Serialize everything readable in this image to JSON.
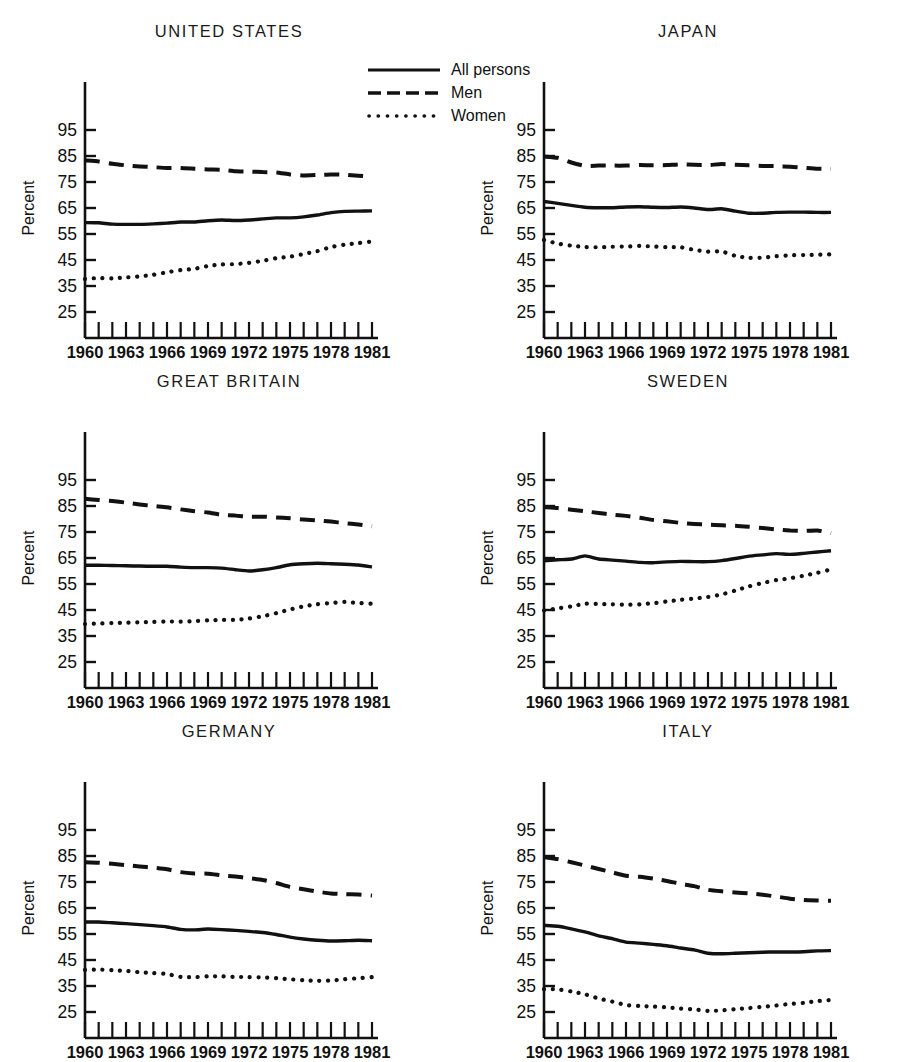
{
  "figure": {
    "ylabel": "Percent",
    "y_ticks": [
      95,
      85,
      75,
      65,
      55,
      45,
      35,
      25
    ],
    "y_tick_labels": [
      "95",
      "85",
      "75",
      "65",
      "55",
      "45",
      "35",
      "25"
    ],
    "x_tick_labels": [
      "1960",
      "1963",
      "1966",
      "1969",
      "1972",
      "1975",
      "1978",
      "1981"
    ],
    "x_label_years": [
      1960,
      1963,
      1966,
      1969,
      1972,
      1975,
      1978,
      1981
    ],
    "line_color": "#111111"
  },
  "legend": {
    "position": "top-center",
    "items": [
      {
        "label": "All persons",
        "style": "solid"
      },
      {
        "label": "Men",
        "style": "dashed"
      },
      {
        "label": "Women",
        "style": "dotted"
      }
    ]
  },
  "chart_data": [
    {
      "type": "line",
      "title": "UNITED STATES",
      "xlabel": "",
      "ylabel": "Percent",
      "xlim": [
        1960,
        1981
      ],
      "ylim": [
        20,
        102
      ],
      "grid": false,
      "legend_position": "figure top-center",
      "x": [
        1960,
        1961,
        1962,
        1963,
        1964,
        1965,
        1966,
        1967,
        1968,
        1969,
        1970,
        1971,
        1972,
        1973,
        1974,
        1975,
        1976,
        1977,
        1978,
        1979,
        1980,
        1981
      ],
      "series": [
        {
          "name": "All persons",
          "style": "solid",
          "values": [
            59.4,
            59.3,
            58.8,
            58.7,
            58.7,
            58.9,
            59.2,
            59.6,
            59.6,
            60.1,
            60.4,
            60.2,
            60.4,
            60.8,
            61.2,
            61.2,
            61.6,
            62.3,
            63.2,
            63.7,
            63.8,
            63.9
          ]
        },
        {
          "name": "Men",
          "style": "dashed",
          "values": [
            83.3,
            82.9,
            82.0,
            81.4,
            81.0,
            80.7,
            80.4,
            80.4,
            80.1,
            79.8,
            79.7,
            79.1,
            79.0,
            78.8,
            78.7,
            77.9,
            77.5,
            77.7,
            77.9,
            77.8,
            77.4,
            77.0
          ]
        },
        {
          "name": "Women",
          "style": "dotted",
          "values": [
            37.7,
            38.1,
            37.9,
            38.3,
            38.7,
            39.3,
            40.3,
            41.1,
            41.6,
            42.7,
            43.3,
            43.4,
            43.9,
            44.7,
            45.7,
            46.3,
            47.3,
            48.4,
            50.0,
            50.9,
            51.5,
            52.1
          ]
        }
      ]
    },
    {
      "type": "line",
      "title": "JAPAN",
      "xlabel": "",
      "ylabel": "Percent",
      "xlim": [
        1960,
        1981
      ],
      "ylim": [
        20,
        102
      ],
      "grid": false,
      "x": [
        1960,
        1961,
        1962,
        1963,
        1964,
        1965,
        1966,
        1967,
        1968,
        1969,
        1970,
        1971,
        1972,
        1973,
        1974,
        1975,
        1976,
        1977,
        1978,
        1979,
        1980,
        1981
      ],
      "series": [
        {
          "name": "All persons",
          "style": "solid",
          "values": [
            67.5,
            66.8,
            66.0,
            65.3,
            65.1,
            65.1,
            65.4,
            65.5,
            65.3,
            65.2,
            65.4,
            65.0,
            64.4,
            64.7,
            63.8,
            63.0,
            63.0,
            63.3,
            63.4,
            63.4,
            63.3,
            63.3
          ]
        },
        {
          "name": "Men",
          "style": "dashed",
          "values": [
            84.8,
            84.3,
            82.5,
            81.2,
            81.3,
            81.3,
            81.3,
            81.5,
            81.4,
            81.5,
            81.8,
            81.6,
            81.5,
            81.9,
            81.6,
            81.4,
            81.2,
            81.1,
            80.9,
            80.5,
            80.1,
            80.0
          ]
        },
        {
          "name": "Women",
          "style": "dotted",
          "values": [
            52.7,
            51.3,
            50.5,
            50.0,
            49.9,
            50.1,
            50.2,
            50.4,
            50.2,
            49.9,
            49.9,
            48.9,
            48.2,
            48.3,
            46.6,
            45.8,
            45.9,
            46.5,
            46.8,
            46.9,
            47.0,
            47.2
          ]
        }
      ]
    },
    {
      "type": "line",
      "title": "GREAT BRITAIN",
      "xlabel": "",
      "ylabel": "Percent",
      "xlim": [
        1960,
        1981
      ],
      "ylim": [
        20,
        102
      ],
      "grid": false,
      "x": [
        1960,
        1961,
        1962,
        1963,
        1964,
        1965,
        1966,
        1967,
        1968,
        1969,
        1970,
        1971,
        1972,
        1973,
        1974,
        1975,
        1976,
        1977,
        1978,
        1979,
        1980,
        1981
      ],
      "series": [
        {
          "name": "All persons",
          "style": "solid",
          "values": [
            62.2,
            62.2,
            62.1,
            62.0,
            61.9,
            61.8,
            61.8,
            61.5,
            61.3,
            61.3,
            61.1,
            60.5,
            60.0,
            60.5,
            61.3,
            62.4,
            62.8,
            63.0,
            62.8,
            62.6,
            62.3,
            61.6
          ]
        },
        {
          "name": "Men",
          "style": "dashed",
          "values": [
            87.8,
            87.3,
            86.9,
            86.3,
            85.6,
            85.0,
            84.5,
            83.7,
            83.0,
            82.5,
            81.6,
            81.3,
            80.9,
            80.9,
            80.6,
            80.3,
            79.8,
            79.5,
            79.0,
            78.4,
            77.9,
            77.2
          ]
        },
        {
          "name": "Women",
          "style": "dotted",
          "values": [
            39.6,
            39.8,
            40.0,
            40.1,
            40.3,
            40.4,
            40.6,
            40.5,
            40.7,
            41.0,
            41.2,
            41.2,
            41.7,
            42.6,
            43.8,
            45.2,
            46.4,
            47.2,
            47.7,
            48.1,
            47.7,
            47.4
          ]
        }
      ]
    },
    {
      "type": "line",
      "title": "SWEDEN",
      "xlabel": "",
      "ylabel": "Percent",
      "xlim": [
        1960,
        1981
      ],
      "ylim": [
        20,
        102
      ],
      "grid": false,
      "x": [
        1960,
        1961,
        1962,
        1963,
        1964,
        1965,
        1966,
        1967,
        1968,
        1969,
        1970,
        1971,
        1972,
        1973,
        1974,
        1975,
        1976,
        1977,
        1978,
        1979,
        1980,
        1981
      ],
      "series": [
        {
          "name": "All persons",
          "style": "solid",
          "values": [
            63.9,
            64.3,
            64.6,
            65.8,
            64.6,
            64.2,
            63.8,
            63.3,
            63.2,
            63.5,
            63.7,
            63.6,
            63.6,
            64.0,
            64.8,
            65.7,
            66.2,
            66.7,
            66.4,
            66.8,
            67.3,
            67.8
          ]
        },
        {
          "name": "Men",
          "style": "dashed",
          "values": [
            84.6,
            84.2,
            83.6,
            83.0,
            82.3,
            81.7,
            81.2,
            80.5,
            79.6,
            79.1,
            78.5,
            78.1,
            77.8,
            77.6,
            77.4,
            77.0,
            76.5,
            76.0,
            75.6,
            75.4,
            75.6,
            74.6
          ]
        },
        {
          "name": "Women",
          "style": "dotted",
          "values": [
            44.8,
            45.6,
            46.4,
            47.4,
            47.3,
            47.2,
            47.0,
            47.2,
            47.6,
            48.3,
            48.9,
            49.4,
            50.0,
            51.0,
            52.5,
            54.1,
            55.4,
            56.5,
            57.2,
            58.2,
            59.3,
            60.6
          ]
        }
      ]
    },
    {
      "type": "line",
      "title": "GERMANY",
      "xlabel": "",
      "ylabel": "Percent",
      "xlim": [
        1960,
        1981
      ],
      "ylim": [
        20,
        102
      ],
      "grid": false,
      "x": [
        1960,
        1961,
        1962,
        1963,
        1964,
        1965,
        1966,
        1967,
        1968,
        1969,
        1970,
        1971,
        1972,
        1973,
        1974,
        1975,
        1976,
        1977,
        1978,
        1979,
        1980,
        1981
      ],
      "series": [
        {
          "name": "All persons",
          "style": "solid",
          "values": [
            59.6,
            59.6,
            59.3,
            59.0,
            58.6,
            58.2,
            57.7,
            56.8,
            56.6,
            56.9,
            56.7,
            56.4,
            56.0,
            55.6,
            54.8,
            53.8,
            53.1,
            52.6,
            52.3,
            52.4,
            52.6,
            52.4
          ]
        },
        {
          "name": "Men",
          "style": "dashed",
          "values": [
            82.6,
            82.4,
            82.0,
            81.5,
            81.0,
            80.5,
            79.9,
            78.8,
            78.3,
            78.2,
            77.6,
            77.1,
            76.5,
            75.8,
            74.6,
            73.1,
            72.2,
            71.3,
            70.6,
            70.3,
            70.2,
            69.8
          ]
        },
        {
          "name": "Women",
          "style": "dotted",
          "values": [
            41.2,
            41.3,
            41.1,
            40.8,
            40.3,
            40.0,
            39.6,
            38.5,
            38.4,
            38.7,
            38.7,
            38.5,
            38.4,
            38.3,
            38.0,
            37.6,
            37.2,
            37.0,
            37.1,
            37.6,
            38.0,
            38.4
          ]
        }
      ]
    },
    {
      "type": "line",
      "title": "ITALY",
      "xlabel": "",
      "ylabel": "Percent",
      "xlim": [
        1960,
        1981
      ],
      "ylim": [
        20,
        102
      ],
      "grid": false,
      "x": [
        1960,
        1961,
        1962,
        1963,
        1964,
        1965,
        1966,
        1967,
        1968,
        1969,
        1970,
        1971,
        1972,
        1973,
        1974,
        1975,
        1976,
        1977,
        1978,
        1979,
        1980,
        1981
      ],
      "series": [
        {
          "name": "All persons",
          "style": "solid",
          "values": [
            58.3,
            58.0,
            57.0,
            55.8,
            54.3,
            53.2,
            51.9,
            51.5,
            51.0,
            50.5,
            49.6,
            48.9,
            47.6,
            47.4,
            47.6,
            47.8,
            48.0,
            48.1,
            48.1,
            48.2,
            48.5,
            48.6
          ]
        },
        {
          "name": "Men",
          "style": "dashed",
          "values": [
            84.6,
            83.8,
            82.6,
            81.3,
            80.0,
            78.7,
            77.4,
            77.0,
            76.3,
            75.4,
            74.3,
            73.4,
            72.0,
            71.4,
            71.0,
            70.6,
            70.1,
            69.4,
            68.6,
            68.1,
            67.9,
            67.8
          ]
        },
        {
          "name": "Women",
          "style": "dotted",
          "values": [
            33.8,
            33.7,
            32.9,
            31.8,
            30.2,
            29.0,
            27.7,
            27.3,
            27.1,
            26.8,
            26.3,
            26.0,
            25.4,
            25.6,
            26.1,
            26.5,
            27.0,
            27.5,
            28.1,
            28.5,
            29.2,
            29.6
          ]
        }
      ]
    }
  ]
}
